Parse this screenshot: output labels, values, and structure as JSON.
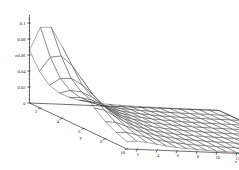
{
  "figure": {
    "type": "surface-mesh-3d",
    "background_color": "#ffffff",
    "line_color": "#303030",
    "text_color": "#202020"
  },
  "chart_data": {
    "type": "line",
    "render_style": "3d-wireframe-mesh-surface",
    "title": "",
    "xlabel": "x",
    "ylabel": "y",
    "zlabel": "z",
    "xlim": [
      1,
      20
    ],
    "ylim": [
      1,
      10
    ],
    "zlim": [
      0,
      0.11
    ],
    "grid": false,
    "legend": "none",
    "x_ticks": [
      2,
      4,
      6,
      8,
      10,
      12,
      14,
      16,
      18,
      20
    ],
    "x_tick_labels": [
      "2",
      "4",
      "6",
      "8",
      "10",
      "12",
      "14",
      "16",
      "18",
      "20"
    ],
    "y_ticks": [
      2,
      4,
      6,
      8,
      10
    ],
    "y_tick_labels": [
      "2",
      "4",
      "6",
      "8",
      "10"
    ],
    "z_ticks": [
      0,
      0.02,
      0.04,
      0.06,
      0.08,
      0.1
    ],
    "z_tick_labels": [
      "0",
      "0.02",
      "0.04",
      "0.06",
      "0.08",
      "0.1"
    ],
    "surface_description": "Single-peaked ridge rising near small x and small-to-mid y, decaying monotonically to a near-zero flat plane at large x",
    "peak": {
      "x": 2.0,
      "y": 2.6,
      "z": 0.108
    },
    "nx": 20,
    "ny": 10,
    "z_matrix_note": "z[y][x] sampled on integer grid x=1..20, y=1..10",
    "z_matrix": [
      [
        0.066,
        0.04,
        0.023,
        0.014,
        0.009,
        0.006,
        0.0042,
        0.003,
        0.0022,
        0.0017,
        0.0013,
        0.001,
        0.0008,
        0.0006,
        0.0005,
        0.0004,
        0.0003,
        0.0003,
        0.0002,
        0.0002
      ],
      [
        0.101,
        0.064,
        0.038,
        0.0235,
        0.0152,
        0.0102,
        0.0071,
        0.0051,
        0.0038,
        0.0029,
        0.0022,
        0.0017,
        0.0013,
        0.0011,
        0.0009,
        0.0007,
        0.0006,
        0.0005,
        0.0004,
        0.0003
      ],
      [
        0.1075,
        0.072,
        0.0445,
        0.0282,
        0.0186,
        0.0127,
        0.009,
        0.0065,
        0.0048,
        0.0037,
        0.0029,
        0.0022,
        0.0018,
        0.0014,
        0.0012,
        0.001,
        0.0008,
        0.0007,
        0.0006,
        0.0005
      ],
      [
        0.09,
        0.0665,
        0.043,
        0.028,
        0.0188,
        0.013,
        0.0093,
        0.0068,
        0.0051,
        0.0039,
        0.0031,
        0.0024,
        0.0019,
        0.0016,
        0.0013,
        0.0011,
        0.0009,
        0.0008,
        0.0007,
        0.0006
      ],
      [
        0.067,
        0.054,
        0.037,
        0.0248,
        0.017,
        0.012,
        0.0087,
        0.0064,
        0.0049,
        0.0038,
        0.003,
        0.0024,
        0.0019,
        0.0016,
        0.0013,
        0.0011,
        0.0009,
        0.0008,
        0.0007,
        0.0006
      ],
      [
        0.047,
        0.041,
        0.03,
        0.0208,
        0.0147,
        0.0105,
        0.0077,
        0.0058,
        0.0044,
        0.0035,
        0.0028,
        0.0022,
        0.0018,
        0.0015,
        0.0012,
        0.001,
        0.0009,
        0.0008,
        0.0007,
        0.0006
      ],
      [
        0.032,
        0.03,
        0.0233,
        0.0168,
        0.0121,
        0.0088,
        0.0066,
        0.005,
        0.0038,
        0.003,
        0.0024,
        0.002,
        0.0016,
        0.0013,
        0.0011,
        0.001,
        0.0008,
        0.0007,
        0.0006,
        0.0005
      ],
      [
        0.0215,
        0.0214,
        0.0175,
        0.0131,
        0.0097,
        0.0072,
        0.0055,
        0.0042,
        0.0033,
        0.0026,
        0.0021,
        0.0017,
        0.0014,
        0.0012,
        0.001,
        0.0008,
        0.0007,
        0.0006,
        0.0006,
        0.0005
      ],
      [
        0.0142,
        0.015,
        0.0128,
        0.0099,
        0.0075,
        0.0057,
        0.0044,
        0.0034,
        0.0027,
        0.0022,
        0.0018,
        0.0015,
        0.0012,
        0.001,
        0.0009,
        0.0007,
        0.0006,
        0.0006,
        0.0005,
        0.0004
      ],
      [
        0.0093,
        0.0103,
        0.0091,
        0.0073,
        0.0057,
        0.0044,
        0.0034,
        0.0027,
        0.0022,
        0.0018,
        0.0015,
        0.0012,
        0.001,
        0.0009,
        0.0007,
        0.0006,
        0.0006,
        0.0005,
        0.0004,
        0.0004
      ]
    ]
  },
  "axes": {
    "z": {
      "label": "z",
      "ticks": [
        {
          "value": 0.1,
          "label": "0.1"
        },
        {
          "value": 0.08,
          "label": "0.08"
        },
        {
          "value": 0.06,
          "label": "0.06"
        },
        {
          "value": 0.04,
          "label": "0.04"
        },
        {
          "value": 0.02,
          "label": "0.02"
        },
        {
          "value": 0,
          "label": "0"
        }
      ]
    },
    "y": {
      "label": "y",
      "ticks": [
        {
          "value": 2,
          "label": "2"
        },
        {
          "value": 4,
          "label": "4"
        },
        {
          "value": 6,
          "label": "6"
        },
        {
          "value": 8,
          "label": "8"
        },
        {
          "value": 10,
          "label": "10"
        }
      ]
    },
    "x": {
      "label": "x",
      "ticks": [
        {
          "value": 20,
          "label": "20"
        },
        {
          "value": 18,
          "label": "18"
        },
        {
          "value": 16,
          "label": "16"
        },
        {
          "value": 14,
          "label": "14"
        },
        {
          "value": 12,
          "label": "12"
        },
        {
          "value": 10,
          "label": "10"
        },
        {
          "value": 8,
          "label": "8"
        },
        {
          "value": 6,
          "label": "6"
        },
        {
          "value": 4,
          "label": "4"
        },
        {
          "value": 2,
          "label": "2"
        }
      ]
    }
  }
}
